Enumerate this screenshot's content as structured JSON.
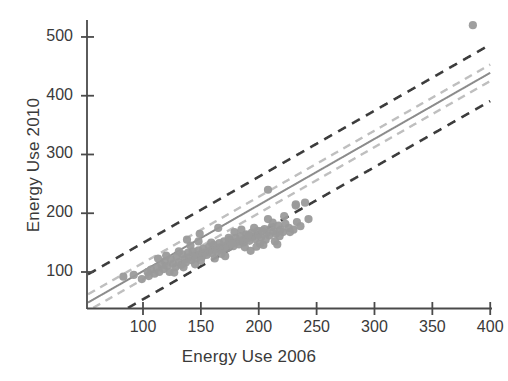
{
  "chart_data": {
    "type": "scatter",
    "title": "",
    "xlabel": "Energy Use 2006",
    "ylabel": "Energy Use 2010",
    "xlim": [
      52,
      400
    ],
    "ylim": [
      40,
      540
    ],
    "xticks": [
      100,
      150,
      200,
      250,
      300,
      350,
      400
    ],
    "yticks": [
      100,
      200,
      300,
      400,
      500
    ],
    "grid": false,
    "legend": null,
    "point_color": "#9a9a9a",
    "fit_line_color": "#8c8c8c",
    "confidence_band_color": "#bfbfbf",
    "prediction_band_color": "#3c3c3c",
    "series": [
      {
        "name": "Buildings",
        "points": [
          [
            83,
            92
          ],
          [
            92,
            95
          ],
          [
            99,
            88
          ],
          [
            104,
            100
          ],
          [
            107,
            104
          ],
          [
            110,
            97
          ],
          [
            112,
            108
          ],
          [
            114,
            100
          ],
          [
            116,
            112
          ],
          [
            118,
            105
          ],
          [
            119,
            118
          ],
          [
            121,
            110
          ],
          [
            123,
            100
          ],
          [
            124,
            122
          ],
          [
            126,
            114
          ],
          [
            128,
            108
          ],
          [
            129,
            126
          ],
          [
            131,
            117
          ],
          [
            133,
            112
          ],
          [
            134,
            130
          ],
          [
            136,
            121
          ],
          [
            137,
            116
          ],
          [
            139,
            133
          ],
          [
            140,
            125
          ],
          [
            142,
            120
          ],
          [
            143,
            135
          ],
          [
            145,
            128
          ],
          [
            146,
            123
          ],
          [
            148,
            137
          ],
          [
            149,
            130
          ],
          [
            151,
            126
          ],
          [
            152,
            140
          ],
          [
            154,
            133
          ],
          [
            155,
            129
          ],
          [
            157,
            143
          ],
          [
            158,
            136
          ],
          [
            160,
            132
          ],
          [
            161,
            146
          ],
          [
            163,
            139
          ],
          [
            164,
            135
          ],
          [
            166,
            149
          ],
          [
            167,
            142
          ],
          [
            169,
            138
          ],
          [
            170,
            152
          ],
          [
            172,
            145
          ],
          [
            173,
            141
          ],
          [
            175,
            155
          ],
          [
            176,
            148
          ],
          [
            178,
            144
          ],
          [
            180,
            158
          ],
          [
            181,
            151
          ],
          [
            183,
            147
          ],
          [
            184,
            161
          ],
          [
            186,
            154
          ],
          [
            187,
            150
          ],
          [
            189,
            164
          ],
          [
            190,
            157
          ],
          [
            192,
            153
          ],
          [
            194,
            167
          ],
          [
            195,
            160
          ],
          [
            197,
            156
          ],
          [
            199,
            170
          ],
          [
            200,
            163
          ],
          [
            202,
            159
          ],
          [
            204,
            146
          ],
          [
            205,
            173
          ],
          [
            207,
            166
          ],
          [
            209,
            162
          ],
          [
            211,
            176
          ],
          [
            213,
            169
          ],
          [
            215,
            165
          ],
          [
            217,
            179
          ],
          [
            219,
            172
          ],
          [
            221,
            168
          ],
          [
            223,
            182
          ],
          [
            120,
            128
          ],
          [
            131,
            135
          ],
          [
            150,
            119
          ],
          [
            168,
            131
          ],
          [
            174,
            158
          ],
          [
            188,
            142
          ],
          [
            196,
            175
          ],
          [
            206,
            155
          ],
          [
            212,
            184
          ],
          [
            218,
            161
          ],
          [
            148,
            152
          ],
          [
            162,
            123
          ],
          [
            179,
            168
          ],
          [
            193,
            136
          ],
          [
            201,
            148
          ],
          [
            226,
            175
          ],
          [
            230,
            172
          ],
          [
            236,
            178
          ],
          [
            145,
            113
          ],
          [
            135,
            108
          ],
          [
            105,
            93
          ],
          [
            113,
            123
          ],
          [
            127,
            99
          ],
          [
            141,
            145
          ],
          [
            159,
            150
          ],
          [
            171,
            127
          ],
          [
            185,
            172
          ],
          [
            198,
            143
          ],
          [
            208,
            190
          ],
          [
            214,
            152
          ],
          [
            232,
            215
          ],
          [
            240,
            218
          ],
          [
            233,
            185
          ],
          [
            243,
            190
          ],
          [
            208,
            240
          ],
          [
            232,
            213
          ],
          [
            149,
            165
          ],
          [
            138,
            155
          ],
          [
            165,
            175
          ],
          [
            177,
            148
          ],
          [
            191,
            163
          ],
          [
            203,
            170
          ],
          [
            216,
            147
          ],
          [
            222,
            195
          ],
          [
            227,
            168
          ],
          [
            385,
            520
          ]
        ]
      }
    ],
    "fit_line": {
      "slope": 1.125,
      "intercept": -11.0
    },
    "confidence_band_offset": 14,
    "prediction_band_offset": 48,
    "n_points": 120
  }
}
